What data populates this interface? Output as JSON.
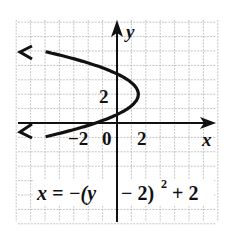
{
  "chart_data": {
    "type": "line",
    "title": "",
    "equation": "x = -(y - 2)^2 + 2",
    "equation_display": {
      "lhs": "x = −(y",
      "rhs": "− 2)",
      "exponent": "2",
      "tail": "+ 2"
    },
    "xlabel": "x",
    "ylabel": "y",
    "tick_labels": {
      "x_neg": "−2",
      "origin": "0",
      "x_pos": "2",
      "y_pos": "2"
    },
    "xlim": [
      -7,
      7
    ],
    "ylim": [
      -7,
      7
    ],
    "grid": true,
    "vertex": [
      2,
      2
    ],
    "opens": "left",
    "series": [
      {
        "name": "x = -(y-2)^2 + 2",
        "points": [
          [
            -7,
            5
          ],
          [
            -4.25,
            4.5
          ],
          [
            -2,
            4
          ],
          [
            -0.25,
            3.5
          ],
          [
            1,
            3
          ],
          [
            1.75,
            2.5
          ],
          [
            2,
            2
          ],
          [
            1.75,
            1.5
          ],
          [
            1,
            1
          ],
          [
            -0.25,
            0.5
          ],
          [
            -2,
            0
          ],
          [
            -4.25,
            -0.5
          ],
          [
            -7,
            -1
          ]
        ]
      }
    ],
    "colors": {
      "curve": "#111111",
      "grid": "#b5b5b5",
      "axes": "#111111"
    }
  }
}
